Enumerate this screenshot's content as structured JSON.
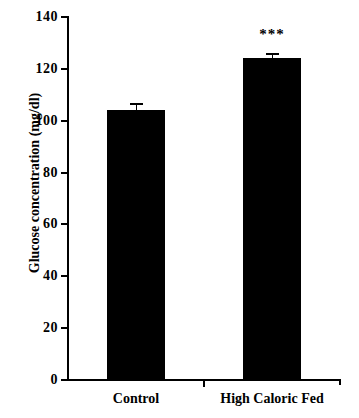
{
  "chart_data": {
    "type": "bar",
    "title": "",
    "xlabel": "",
    "ylabel": "Glucose concentration (mg/dl)",
    "categories": [
      "Control",
      "High Caloric Fed"
    ],
    "values": [
      104,
      124
    ],
    "errors": [
      3,
      2
    ],
    "annotations": [
      {
        "category": "High Caloric Fed",
        "text": "***"
      }
    ],
    "ylim": [
      0,
      140
    ],
    "yticks": [
      0,
      20,
      40,
      60,
      80,
      100,
      120,
      140
    ],
    "ytick_labels": [
      "0",
      "20",
      "40",
      "60",
      "80",
      "100",
      "120",
      "140"
    ],
    "grid": false,
    "legend": false,
    "bar_color": "#000000",
    "axis_color": "#000000",
    "background_color": "#ffffff"
  }
}
